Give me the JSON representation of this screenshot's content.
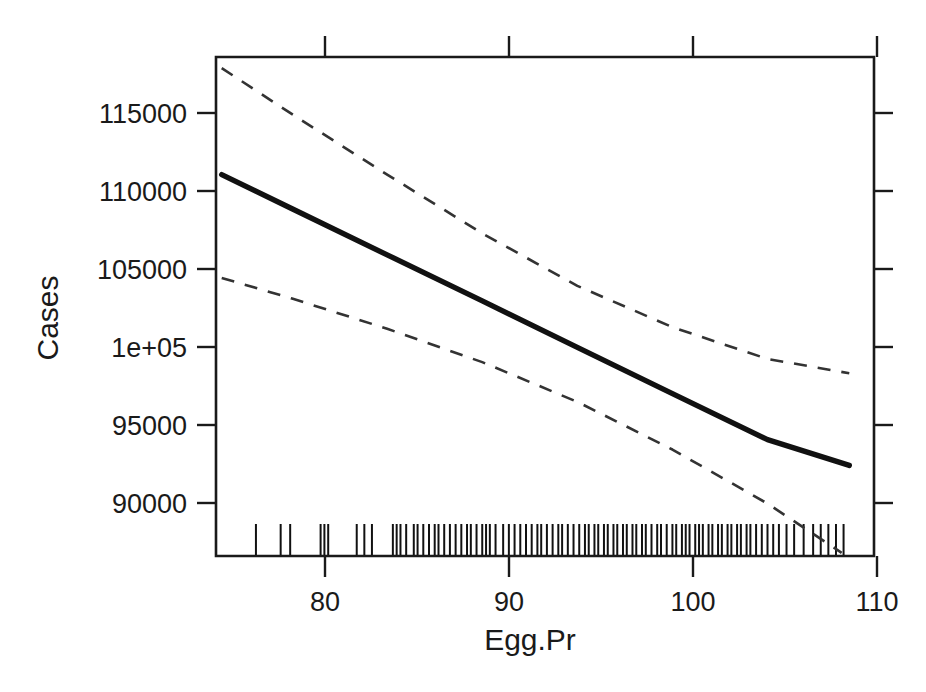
{
  "chart_data": {
    "type": "line",
    "title": "",
    "xlabel": "Egg.Pr",
    "ylabel": "Cases",
    "xlim": [
      76.0,
      110.6
    ],
    "ylim": [
      87200,
      118600
    ],
    "grid": false,
    "legend": "none",
    "xticks": [
      80,
      90,
      100,
      110
    ],
    "xtick_labels": [
      "80",
      "90",
      "100",
      "110"
    ],
    "yticks": [
      90000,
      95000,
      100000,
      105000,
      110000,
      115000
    ],
    "ytick_labels": [
      "90000",
      "95000",
      "1e+05",
      "105000",
      "110000",
      "115000"
    ],
    "series": [
      {
        "name": "fit",
        "style": "solid",
        "x": [
          76.3,
          80.0,
          85.0,
          90.0,
          95.0,
          100.0,
          105.0,
          109.3
        ],
        "values": [
          111200,
          109050,
          106150,
          103250,
          100330,
          97420,
          94520,
          92900
        ]
      },
      {
        "name": "upper-confidence-band",
        "style": "dashed",
        "x": [
          76.3,
          80.0,
          85.0,
          90.0,
          95.0,
          100.0,
          105.0,
          109.3
        ],
        "values": [
          117900,
          115000,
          111200,
          107500,
          104200,
          101600,
          99600,
          98700
        ]
      },
      {
        "name": "lower-confidence-band",
        "style": "dashed",
        "x": [
          76.3,
          80.0,
          85.0,
          90.0,
          95.0,
          100.0,
          105.0,
          108.9
        ],
        "values": [
          104700,
          103400,
          101500,
          99400,
          96900,
          93900,
          90500,
          87400
        ]
      }
    ],
    "rug": {
      "position": "bottom",
      "values": [
        78.1,
        79.4,
        79.9,
        81.5,
        81.7,
        81.9,
        83.4,
        83.8,
        84.2,
        85.3,
        85.5,
        85.7,
        86.0,
        86.4,
        86.6,
        86.9,
        87.2,
        87.5,
        87.7,
        88.0,
        88.3,
        88.6,
        88.9,
        89.2,
        89.4,
        89.7,
        90.0,
        90.2,
        90.4,
        90.7,
        91.1,
        91.4,
        91.7,
        92.0,
        92.3,
        92.6,
        92.9,
        93.1,
        93.4,
        93.7,
        94.0,
        94.2,
        94.5,
        94.8,
        95.1,
        95.4,
        95.6,
        95.9,
        96.1,
        96.4,
        96.6,
        96.9,
        97.1,
        97.4,
        97.6,
        97.9,
        98.1,
        98.4,
        98.6,
        98.9,
        99.2,
        99.4,
        99.7,
        100.0,
        100.2,
        100.5,
        100.7,
        100.9,
        101.2,
        101.4,
        101.6,
        101.9,
        102.1,
        102.4,
        102.6,
        102.9,
        103.1,
        103.4,
        103.6,
        103.9,
        104.1,
        104.4,
        104.7,
        105.0,
        105.3,
        105.6,
        106.0,
        106.4,
        106.9,
        107.4,
        107.8,
        108.2,
        108.6,
        109.0
      ]
    }
  }
}
